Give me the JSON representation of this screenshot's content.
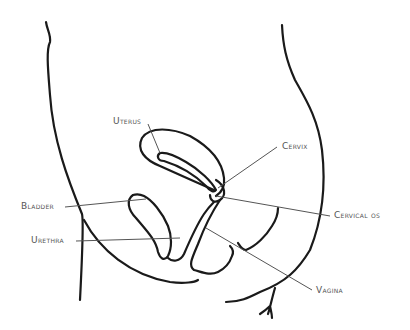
{
  "diagram": {
    "type": "anatomical-line-drawing",
    "stroke_color": "#1a1a1a",
    "leader_color": "#555555",
    "text_color": "#555555"
  },
  "labels": [
    {
      "id": "uterus",
      "text": "Uterus",
      "x": 113,
      "y": 118
    },
    {
      "id": "cervix",
      "text": "Cervix",
      "x": 282,
      "y": 143
    },
    {
      "id": "bladder",
      "text": "Bladder",
      "x": 21,
      "y": 202
    },
    {
      "id": "cervical-os",
      "text": "Cervical os",
      "x": 334,
      "y": 212
    },
    {
      "id": "urethra",
      "text": "Urethra",
      "x": 31,
      "y": 236
    },
    {
      "id": "vagina",
      "text": "Vagina",
      "x": 316,
      "y": 288
    }
  ]
}
